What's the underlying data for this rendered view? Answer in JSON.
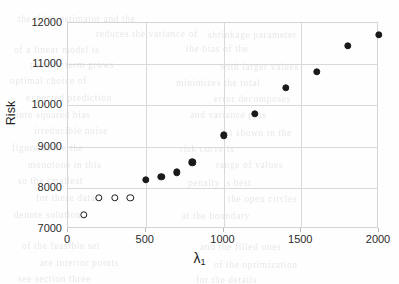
{
  "chart_data": {
    "type": "scatter",
    "title": "",
    "xlabel": "λ₁",
    "ylabel": "Risk",
    "xlim": [
      0,
      2000
    ],
    "ylim": [
      7000,
      12000
    ],
    "xticks": [
      0,
      500,
      1000,
      1500,
      2000
    ],
    "yticks": [
      7000,
      8000,
      9000,
      10000,
      11000,
      12000
    ],
    "grid": true,
    "legend": "none",
    "series": [
      {
        "name": "open-markers",
        "marker": "open-circle",
        "color": "#1a1a1a",
        "points": [
          {
            "x": 100,
            "y": 7340
          },
          {
            "x": 200,
            "y": 7760
          },
          {
            "x": 300,
            "y": 7760
          },
          {
            "x": 400,
            "y": 7760
          }
        ]
      },
      {
        "name": "filled-markers",
        "marker": "filled-circle",
        "color": "#1a1a1a",
        "points": [
          {
            "x": 500,
            "y": 8200
          },
          {
            "x": 600,
            "y": 8270
          },
          {
            "x": 700,
            "y": 8380
          },
          {
            "x": 800,
            "y": 8620
          },
          {
            "x": 1000,
            "y": 9270
          },
          {
            "x": 1200,
            "y": 9790
          },
          {
            "x": 1400,
            "y": 10430
          },
          {
            "x": 1600,
            "y": 10820
          },
          {
            "x": 1800,
            "y": 11440
          },
          {
            "x": 2000,
            "y": 11720
          }
        ]
      }
    ]
  },
  "axis_titles": {
    "y": "Risk",
    "x_symbol": "λ",
    "x_subscript": "1"
  },
  "tick_labels": {
    "y": [
      "12000",
      "11000",
      "10000",
      "9000",
      "8000",
      "7000"
    ],
    "x": [
      "0",
      "500",
      "1000",
      "1500",
      "2000"
    ]
  },
  "colors": {
    "marker": "#1a1a1a",
    "grid": "#d9d9d9",
    "frame": "#d4d4d4",
    "text": "#2b2b2b",
    "background": "#fefefe"
  },
  "background_bleed": {
    "note": "faint show-through text from the reverse of the scanned page",
    "lines": [
      {
        "text": "the ridge estimator and the",
        "x": 18,
        "y": 14
      },
      {
        "text": "reduces the variance of",
        "x": 96,
        "y": 29
      },
      {
        "text": "shrinkage parameter",
        "x": 208,
        "y": 30
      },
      {
        "text": "of a linear model is",
        "x": 14,
        "y": 45
      },
      {
        "text": "the bias of the",
        "x": 186,
        "y": 44
      },
      {
        "text": "penalty term grows",
        "x": 30,
        "y": 60
      },
      {
        "text": "with larger values",
        "x": 220,
        "y": 62
      },
      {
        "text": "optimal choice of",
        "x": 10,
        "y": 76
      },
      {
        "text": "minimizes the total",
        "x": 176,
        "y": 78
      },
      {
        "text": "expected prediction",
        "x": 26,
        "y": 93
      },
      {
        "text": "error decomposes",
        "x": 214,
        "y": 94
      },
      {
        "text": "into squared bias",
        "x": 16,
        "y": 110
      },
      {
        "text": "and variance plus",
        "x": 190,
        "y": 110
      },
      {
        "text": "irreducible noise",
        "x": 34,
        "y": 126
      },
      {
        "text": "as shown in the",
        "x": 224,
        "y": 128
      },
      {
        "text": "figure above the",
        "x": 12,
        "y": 143
      },
      {
        "text": "risk curve is",
        "x": 180,
        "y": 144
      },
      {
        "text": "monotone in this",
        "x": 28,
        "y": 160
      },
      {
        "text": "range of values",
        "x": 216,
        "y": 160
      },
      {
        "text": "so the smallest",
        "x": 18,
        "y": 176
      },
      {
        "text": "penalty is best",
        "x": 188,
        "y": 178
      },
      {
        "text": "for these data",
        "x": 36,
        "y": 193
      },
      {
        "text": "the open circles",
        "x": 228,
        "y": 194
      },
      {
        "text": "denote solutions",
        "x": 14,
        "y": 210
      },
      {
        "text": "at the boundary",
        "x": 182,
        "y": 211
      },
      {
        "text": "of the feasible set",
        "x": 22,
        "y": 241
      },
      {
        "text": "and the filled ones",
        "x": 200,
        "y": 242
      },
      {
        "text": "are interior points",
        "x": 40,
        "y": 258
      },
      {
        "text": "of the optimization",
        "x": 214,
        "y": 260
      },
      {
        "text": "see section three",
        "x": 18,
        "y": 274
      },
      {
        "text": "for the details",
        "x": 196,
        "y": 275
      }
    ]
  }
}
